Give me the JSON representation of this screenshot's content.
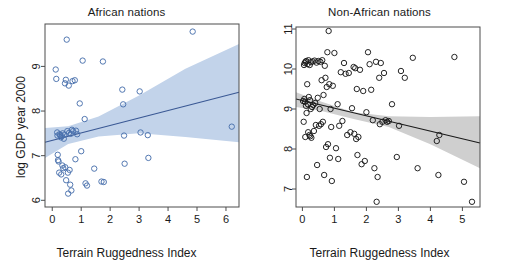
{
  "figure": {
    "background": "#ffffff",
    "panels": [
      {
        "id": "african",
        "title": "African nations",
        "xlabel": "Terrain Ruggedness Index",
        "ylabel": "log GDP year 2000",
        "line_color": "#3a5894",
        "band_color": "#c2d3ea",
        "point_color": "#4a71ad"
      },
      {
        "id": "non-african",
        "title": "Non-African nations",
        "xlabel": "Terrain Ruggedness Index",
        "ylabel": "log GDP year 2000",
        "line_color": "#1a1a1a",
        "band_color": "#cfcfcf",
        "point_color": "#1a1a1a"
      }
    ]
  },
  "chart_data": [
    {
      "type": "scatter",
      "title": "African nations",
      "xlabel": "Terrain Ruggedness Index",
      "ylabel": "log GDP year 2000",
      "xlim": [
        -0.25,
        6.45
      ],
      "ylim": [
        5.85,
        9.95
      ],
      "xticks": [
        0,
        1,
        2,
        3,
        4,
        5,
        6
      ],
      "yticks": [
        6,
        7,
        8,
        9
      ],
      "xticklabels": [
        "0",
        "1",
        "2",
        "3",
        "4",
        "5",
        "6"
      ],
      "yticklabels": [
        "6",
        "7",
        "8",
        "9"
      ],
      "grid": false,
      "legend": "none",
      "point_color": "#4a71ad",
      "marker": "open-circle",
      "points": [
        [
          0.12,
          8.93
        ],
        [
          0.14,
          8.72
        ],
        [
          0.17,
          7.52
        ],
        [
          0.18,
          7.45
        ],
        [
          0.19,
          7.02
        ],
        [
          0.2,
          6.9
        ],
        [
          0.22,
          6.87
        ],
        [
          0.24,
          6.62
        ],
        [
          0.25,
          7.48
        ],
        [
          0.27,
          7.46
        ],
        [
          0.3,
          7.41
        ],
        [
          0.31,
          6.58
        ],
        [
          0.33,
          7.44
        ],
        [
          0.35,
          6.78
        ],
        [
          0.36,
          7.5
        ],
        [
          0.38,
          6.72
        ],
        [
          0.4,
          7.38
        ],
        [
          0.42,
          7.47
        ],
        [
          0.44,
          8.62
        ],
        [
          0.45,
          6.74
        ],
        [
          0.47,
          8.7
        ],
        [
          0.48,
          6.45
        ],
        [
          0.5,
          9.6
        ],
        [
          0.52,
          7.55
        ],
        [
          0.54,
          6.62
        ],
        [
          0.55,
          6.15
        ],
        [
          0.57,
          8.57
        ],
        [
          0.58,
          7.51
        ],
        [
          0.6,
          6.68
        ],
        [
          0.62,
          6.35
        ],
        [
          0.64,
          7.49
        ],
        [
          0.66,
          6.22
        ],
        [
          0.68,
          7.58
        ],
        [
          0.7,
          8.67
        ],
        [
          0.72,
          7.55
        ],
        [
          0.78,
          8.69
        ],
        [
          0.8,
          6.92
        ],
        [
          0.82,
          7.56
        ],
        [
          0.86,
          7.48
        ],
        [
          0.95,
          8.17
        ],
        [
          1.0,
          7.1
        ],
        [
          1.05,
          9.13
        ],
        [
          1.12,
          7.82
        ],
        [
          1.15,
          6.38
        ],
        [
          1.2,
          6.33
        ],
        [
          1.45,
          6.71
        ],
        [
          1.7,
          6.42
        ],
        [
          1.75,
          9.11
        ],
        [
          1.78,
          6.41
        ],
        [
          2.42,
          8.48
        ],
        [
          2.45,
          8.15
        ],
        [
          2.48,
          7.45
        ],
        [
          2.5,
          6.82
        ],
        [
          3.02,
          8.44
        ],
        [
          3.05,
          7.52
        ],
        [
          3.3,
          7.46
        ],
        [
          3.32,
          6.95
        ],
        [
          4.85,
          9.78
        ],
        [
          6.2,
          7.65
        ]
      ],
      "fit_line": {
        "x": [
          -0.25,
          6.45
        ],
        "y": [
          7.3,
          8.42
        ]
      },
      "confidence_band": {
        "x": [
          -0.25,
          0.55,
          1.6,
          3.0,
          4.6,
          6.45
        ],
        "upper": [
          7.62,
          7.66,
          7.88,
          8.35,
          8.95,
          9.5
        ],
        "lower": [
          6.95,
          7.26,
          7.43,
          7.5,
          7.42,
          7.3
        ]
      }
    },
    {
      "type": "scatter",
      "title": "Non-African nations",
      "xlabel": "Terrain Ruggedness Index",
      "ylabel": "log GDP year 2000",
      "xlim": [
        -0.2,
        5.55
      ],
      "ylim": [
        6.55,
        11.05
      ],
      "xticks": [
        0,
        1,
        2,
        3,
        4,
        5
      ],
      "yticks": [
        7,
        8,
        9,
        10,
        11
      ],
      "xticklabels": [
        "0",
        "1",
        "2",
        "3",
        "4",
        "5"
      ],
      "yticklabels": [
        "7",
        "8",
        "9",
        "10",
        "11"
      ],
      "grid": false,
      "legend": "none",
      "point_color": "#1a1a1a",
      "marker": "open-circle",
      "points": [
        [
          0.02,
          9.2
        ],
        [
          0.04,
          8.68
        ],
        [
          0.05,
          10.1
        ],
        [
          0.06,
          9.25
        ],
        [
          0.07,
          10.15
        ],
        [
          0.08,
          9.18
        ],
        [
          0.09,
          8.3
        ],
        [
          0.1,
          10.18
        ],
        [
          0.11,
          9.08
        ],
        [
          0.12,
          10.2
        ],
        [
          0.13,
          8.9
        ],
        [
          0.14,
          7.3
        ],
        [
          0.15,
          9.62
        ],
        [
          0.16,
          10.12
        ],
        [
          0.17,
          9.12
        ],
        [
          0.18,
          8.42
        ],
        [
          0.19,
          10.22
        ],
        [
          0.2,
          9.3
        ],
        [
          0.22,
          8.35
        ],
        [
          0.23,
          10.1
        ],
        [
          0.24,
          9.22
        ],
        [
          0.25,
          8.32
        ],
        [
          0.26,
          9.0
        ],
        [
          0.27,
          10.17
        ],
        [
          0.28,
          8.28
        ],
        [
          0.3,
          9.05
        ],
        [
          0.32,
          10.19
        ],
        [
          0.34,
          9.1
        ],
        [
          0.36,
          8.45
        ],
        [
          0.38,
          10.21
        ],
        [
          0.4,
          9.15
        ],
        [
          0.42,
          8.6
        ],
        [
          0.44,
          10.16
        ],
        [
          0.46,
          7.6
        ],
        [
          0.48,
          9.28
        ],
        [
          0.5,
          10.2
        ],
        [
          0.52,
          8.58
        ],
        [
          0.54,
          9.0
        ],
        [
          0.56,
          10.18
        ],
        [
          0.58,
          8.62
        ],
        [
          0.6,
          9.72
        ],
        [
          0.62,
          10.22
        ],
        [
          0.64,
          8.68
        ],
        [
          0.66,
          9.35
        ],
        [
          0.68,
          7.35
        ],
        [
          0.7,
          10.08
        ],
        [
          0.72,
          9.78
        ],
        [
          0.74,
          8.05
        ],
        [
          0.76,
          9.55
        ],
        [
          0.78,
          10.42
        ],
        [
          0.8,
          8.12
        ],
        [
          0.82,
          10.95
        ],
        [
          0.84,
          9.62
        ],
        [
          0.86,
          7.78
        ],
        [
          0.88,
          9.0
        ],
        [
          0.9,
          8.55
        ],
        [
          0.92,
          7.2
        ],
        [
          0.95,
          9.58
        ],
        [
          1.0,
          10.4
        ],
        [
          1.05,
          8.02
        ],
        [
          1.1,
          9.12
        ],
        [
          1.12,
          7.75
        ],
        [
          1.15,
          8.58
        ],
        [
          1.2,
          9.92
        ],
        [
          1.25,
          8.7
        ],
        [
          1.3,
          10.15
        ],
        [
          1.35,
          9.88
        ],
        [
          1.4,
          8.35
        ],
        [
          1.45,
          9.9
        ],
        [
          1.5,
          8.42
        ],
        [
          1.55,
          9.02
        ],
        [
          1.6,
          10.05
        ],
        [
          1.62,
          8.38
        ],
        [
          1.65,
          10.02
        ],
        [
          1.68,
          8.25
        ],
        [
          1.7,
          9.5
        ],
        [
          1.72,
          7.85
        ],
        [
          1.75,
          8.3
        ],
        [
          1.8,
          9.98
        ],
        [
          1.85,
          7.62
        ],
        [
          1.9,
          9.45
        ],
        [
          1.95,
          7.7
        ],
        [
          2.0,
          8.92
        ],
        [
          2.05,
          10.42
        ],
        [
          2.1,
          10.12
        ],
        [
          2.15,
          9.48
        ],
        [
          2.2,
          8.72
        ],
        [
          2.25,
          7.52
        ],
        [
          2.3,
          10.18
        ],
        [
          2.32,
          6.68
        ],
        [
          2.35,
          7.3
        ],
        [
          2.4,
          9.78
        ],
        [
          2.42,
          8.62
        ],
        [
          2.45,
          10.15
        ],
        [
          2.5,
          8.68
        ],
        [
          2.55,
          9.9
        ],
        [
          2.6,
          8.72
        ],
        [
          2.65,
          8.68
        ],
        [
          2.7,
          8.7
        ],
        [
          2.8,
          9.12
        ],
        [
          2.95,
          7.8
        ],
        [
          3.02,
          8.58
        ],
        [
          3.08,
          9.95
        ],
        [
          3.2,
          9.78
        ],
        [
          3.45,
          10.28
        ],
        [
          3.6,
          7.52
        ],
        [
          4.2,
          8.2
        ],
        [
          4.25,
          7.35
        ],
        [
          4.75,
          10.3
        ],
        [
          4.28,
          8.35
        ],
        [
          5.05,
          7.18
        ],
        [
          5.3,
          6.68
        ]
      ],
      "fit_line": {
        "x": [
          -0.2,
          5.55
        ],
        "y": [
          9.25,
          8.15
        ]
      },
      "confidence_band": {
        "x": [
          -0.2,
          0.6,
          1.6,
          2.7,
          4.0,
          5.55
        ],
        "upper": [
          9.42,
          9.18,
          8.92,
          8.82,
          8.8,
          8.82
        ],
        "lower": [
          9.05,
          8.95,
          8.75,
          8.55,
          8.12,
          7.52
        ]
      }
    }
  ]
}
